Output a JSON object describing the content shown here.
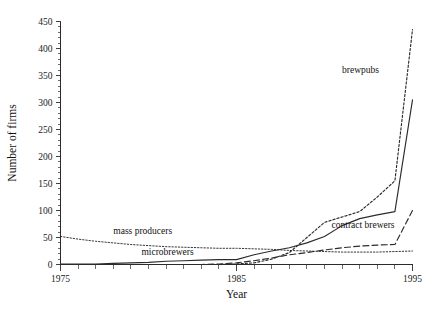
{
  "chart_data": {
    "type": "line",
    "title": "",
    "xlabel": "Year",
    "ylabel": "Number of firms",
    "xlim": [
      1975,
      1995
    ],
    "ylim": [
      0,
      450
    ],
    "grid": false,
    "legend_position": "inline-annotations",
    "x_ticks": [
      1975,
      1985,
      1995
    ],
    "x_tick_labels": [
      "1975",
      "1985",
      "1995"
    ],
    "x_minor_tick_interval": 1,
    "y_ticks": [
      0,
      50,
      100,
      150,
      200,
      250,
      300,
      350,
      400,
      450
    ],
    "y_tick_labels": [
      "0",
      "50",
      "100",
      "150",
      "200",
      "250",
      "300",
      "350",
      "400",
      "450"
    ],
    "y_minor_tick_interval": 10,
    "x": [
      1975,
      1976,
      1977,
      1978,
      1979,
      1980,
      1981,
      1982,
      1983,
      1984,
      1985,
      1986,
      1987,
      1988,
      1989,
      1990,
      1991,
      1992,
      1993,
      1994,
      1995
    ],
    "series": [
      {
        "name": "brewpubs",
        "style": "dotted",
        "color": "#2b2b2b",
        "label": "brewpubs",
        "values": [
          0,
          0,
          0,
          0,
          0,
          0,
          0,
          0,
          0,
          0,
          1,
          3,
          10,
          22,
          50,
          78,
          88,
          98,
          125,
          155,
          435
        ]
      },
      {
        "name": "microbrewers",
        "style": "solid",
        "color": "#2b2b2b",
        "label": "microbrewers",
        "values": [
          1,
          1,
          1,
          2,
          3,
          4,
          6,
          7,
          8,
          9,
          9,
          18,
          25,
          31,
          40,
          52,
          72,
          85,
          92,
          98,
          305
        ]
      },
      {
        "name": "contract brewers",
        "style": "dashed",
        "color": "#2b2b2b",
        "label": "contract brewers",
        "values": [
          0,
          0,
          0,
          0,
          0,
          0,
          0,
          0,
          0,
          1,
          3,
          7,
          12,
          18,
          22,
          27,
          31,
          34,
          36,
          37,
          100
        ]
      },
      {
        "name": "mass producers",
        "style": "dotted-fine",
        "color": "#2b2b2b",
        "label": "mass producers",
        "values": [
          52,
          47,
          43,
          40,
          37,
          35,
          33,
          32,
          31,
          30,
          30,
          29,
          28,
          26,
          25,
          24,
          23,
          23,
          23,
          24,
          25
        ]
      }
    ],
    "annotations": [
      {
        "text": "brewpubs",
        "x": 1991.0,
        "y": 355
      },
      {
        "text": "microbrewers",
        "x": 1979.6,
        "y": 17
      },
      {
        "text": "contract brewers",
        "x": 1990.4,
        "y": 68
      },
      {
        "text": "mass producers",
        "x": 1978.0,
        "y": 57
      }
    ]
  }
}
